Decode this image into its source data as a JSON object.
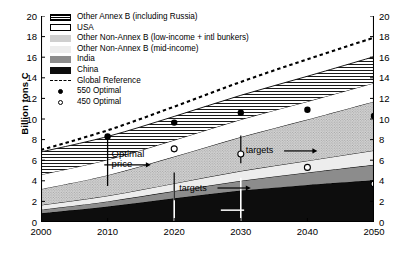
{
  "chart_data": {
    "type": "area",
    "stacked": true,
    "title": "",
    "xlabel": "",
    "ylabel": "Billion tons C",
    "xlim": [
      2000,
      2050
    ],
    "ylim": [
      0,
      20
    ],
    "xticks": [
      "2000",
      "2010",
      "2020",
      "2030",
      "2040",
      "2050"
    ],
    "yticks": [
      "0",
      "2",
      "4",
      "6",
      "8",
      "10",
      "12",
      "14",
      "16",
      "18",
      "20"
    ],
    "yticks_right": [
      "0",
      "2",
      "4",
      "6",
      "8",
      "10",
      "12",
      "14",
      "16",
      "18",
      "20"
    ],
    "grid": false,
    "legend_position": "top-left",
    "x": [
      2000,
      2010,
      2020,
      2030,
      2040,
      2050
    ],
    "series": [
      {
        "name": "China",
        "key": "china",
        "fill": "#0d0d0d",
        "pattern": "solid",
        "values": [
          0.85,
          1.5,
          2.3,
          3.05,
          3.6,
          4.05
        ]
      },
      {
        "name": "India",
        "key": "india",
        "fill": "#8c8c8c",
        "pattern": "solid",
        "values": [
          0.35,
          0.5,
          0.7,
          0.95,
          1.2,
          1.5
        ]
      },
      {
        "name": "Other Non-Annex B (mid-income)",
        "key": "mid_income",
        "fill": "#ededed",
        "pattern": "solid",
        "values": [
          0.45,
          0.55,
          0.75,
          0.95,
          1.15,
          1.4
        ]
      },
      {
        "name": "Other Non-Annex B (low-income + intl bunkers)",
        "key": "low_income",
        "fill": "#cfcfcf",
        "pattern": "stipple",
        "values": [
          1.55,
          2.0,
          2.6,
          3.3,
          4.0,
          4.75
        ]
      },
      {
        "name": "USA",
        "key": "usa",
        "fill": "#ffffff",
        "pattern": "plain",
        "values": [
          1.4,
          1.5,
          1.6,
          1.7,
          1.75,
          1.8
        ]
      },
      {
        "name": "Other Annex B (including Russia)",
        "key": "other_annex_b",
        "fill": "#ffffff",
        "pattern": "hlines",
        "values": [
          2.2,
          2.25,
          2.3,
          2.35,
          2.45,
          2.55
        ]
      }
    ],
    "stack_totals": [
      6.8,
      8.3,
      10.25,
      12.3,
      14.15,
      16.05
    ],
    "reference_line": {
      "name": "Global Reference",
      "style": "dashed",
      "x": [
        2000,
        2010,
        2020,
        2030,
        2040,
        2050
      ],
      "values": [
        7.0,
        8.9,
        11.2,
        13.6,
        15.8,
        17.9
      ]
    },
    "markers": [
      {
        "name": "550 Optimal",
        "style": "filled-circle",
        "points": [
          [
            2010,
            8.3
          ],
          [
            2020,
            9.65
          ],
          [
            2030,
            10.6
          ],
          [
            2040,
            10.9
          ],
          [
            2050,
            10.3
          ]
        ]
      },
      {
        "name": "450 Optimal",
        "style": "open-circle",
        "points": [
          [
            2020,
            7.1
          ],
          [
            2030,
            6.6
          ],
          [
            2040,
            5.3
          ],
          [
            2050,
            3.7
          ]
        ]
      }
    ],
    "annotations": [
      {
        "text": "Optimal price",
        "x": 2010,
        "y": 6.6,
        "arrow": "down",
        "at": 2010
      },
      {
        "text": "targets",
        "x": 2020,
        "y": 3.3,
        "arrow": "right"
      },
      {
        "text": "targets",
        "x": 2030,
        "y": 6.9,
        "arrow": "right"
      }
    ]
  },
  "legend": {
    "items": [
      {
        "label": "Other Annex B (including Russia)",
        "swatch": "hlines-swatch"
      },
      {
        "label": "USA",
        "swatch": "white-swatch"
      },
      {
        "label": "Other Non-Annex B (low-income + intl bunkers)",
        "swatch": "stipple-swatch"
      },
      {
        "label": "Other Non-Annex B (mid-income)",
        "swatch": "light-swatch"
      },
      {
        "label": "India",
        "swatch": "gray-swatch"
      },
      {
        "label": "China",
        "swatch": "black-swatch"
      },
      {
        "label": "Global Reference",
        "swatch": "dashed-line-swatch"
      },
      {
        "label": "550 Optimal",
        "swatch": "filled-circle-marker"
      },
      {
        "label": "450 Optimal",
        "swatch": "open-circle-marker"
      }
    ]
  },
  "colors": {
    "china": "#0d0d0d",
    "india": "#8c8c8c",
    "mid_income": "#ededed",
    "low_income": "#cfcfcf",
    "usa": "#ffffff",
    "other_annex_b": "#ffffff",
    "axis": "#000000"
  }
}
